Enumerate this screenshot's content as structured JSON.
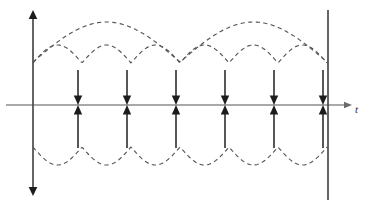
{
  "figure": {
    "name": "impulse-train-with-envelopes",
    "width": 368,
    "height": 208,
    "background_color": "#ffffff"
  },
  "axes": {
    "t_axis": {
      "label": "t",
      "label_x": 355,
      "label_y": 113,
      "y": 105,
      "x_start": 6,
      "x_end": 352,
      "color": "#8c8c8c",
      "arrowhead": "right"
    },
    "vertical_axis": {
      "x": 33,
      "y_top": 10,
      "y_bottom": 196,
      "color": "#4a4a4a",
      "arrowhead": "both"
    },
    "right_boundary": {
      "x": 328,
      "y_top": 10,
      "y_bottom": 200,
      "color": "#4a4a4a",
      "arrowhead": "none"
    }
  },
  "impulses": {
    "count": 6,
    "spacing": 49,
    "x_positions": [
      78,
      127,
      176,
      225,
      274,
      323
    ],
    "stem_top_y": 70,
    "stem_bottom_y": 148,
    "baseline_y": 105,
    "direction": "bidirectional",
    "color": "#3a3a3a",
    "head_color": "#1c1c1c"
  },
  "envelopes": {
    "color": "#555555",
    "dash_pattern": "4.2 3.4",
    "upper_slow": {
      "name": "slow-modulation-envelope",
      "x_start": 33,
      "x_end": 328,
      "baseline_y": 62,
      "amplitude": 40,
      "period": 147,
      "peak_y": 22
    },
    "upper_fast": {
      "name": "fast-rectified-envelope-upper",
      "x_start": 33,
      "x_end": 328,
      "baseline_y": 63,
      "amplitude": 18,
      "period": 49,
      "peak_y": 45
    },
    "lower_fast": {
      "name": "fast-rectified-envelope-lower",
      "x_start": 33,
      "x_end": 328,
      "baseline_y": 147,
      "amplitude": 18,
      "period": 49,
      "trough_y": 165
    }
  },
  "chart_data": {
    "type": "line",
    "title": "",
    "subtitle": "",
    "xlabel": "t",
    "ylabel": "",
    "grid": false,
    "legend": "none",
    "xlim": [
      0,
      368
    ],
    "ylim": [
      0,
      208
    ],
    "series": [
      {
        "name": "impulse-train",
        "type": "stem",
        "x": [
          78,
          127,
          176,
          225,
          274,
          323
        ],
        "values": [
          1,
          1,
          1,
          1,
          1,
          1
        ],
        "note": "each impulse drawn as a downward arrow meeting an upward arrow at the axis"
      },
      {
        "name": "slow-modulation-envelope",
        "type": "dashed-arc",
        "period": 147,
        "amplitude": 40,
        "arcs": 2
      },
      {
        "name": "fast-rectified-envelope-upper",
        "type": "dashed-scallop",
        "period": 49,
        "amplitude": 18,
        "lobes": 6
      },
      {
        "name": "fast-rectified-envelope-lower",
        "type": "dashed-scallop",
        "period": 49,
        "amplitude": 18,
        "lobes": 6
      }
    ]
  }
}
